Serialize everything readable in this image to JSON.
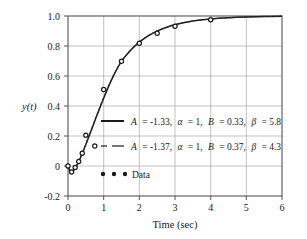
{
  "chart_data": {
    "type": "line",
    "title": "",
    "xlabel": "Time (sec)",
    "ylabel": "y(t)",
    "xlim": [
      0,
      6
    ],
    "ylim": [
      -0.2,
      1.0
    ],
    "grid": true,
    "xticks": [
      0,
      1,
      2,
      3,
      4,
      5,
      6
    ],
    "xtick_labels": [
      "0",
      "1",
      "2",
      "3",
      "4",
      "5",
      "6"
    ],
    "yticks": [
      -0.2,
      0,
      0.2,
      0.4,
      0.6,
      0.8,
      1.0
    ],
    "ytick_labels": [
      "-0.2",
      "0",
      "0.2",
      "0.4",
      "0.6",
      "0.8",
      "1.0"
    ],
    "legend_position": "center",
    "series": [
      {
        "name": "model-1-solid",
        "style": "solid",
        "color": "#1a1a1a",
        "label_parts": {
          "A_name": "A",
          "A_value": "= -1.33,",
          "alpha_name": "α",
          "alpha_value": "= 1,",
          "B_name": "B",
          "B_value": "= 0.33,",
          "beta_name": "β",
          "beta_value": "= 5.8"
        },
        "params": {
          "A": -1.33,
          "alpha": 1,
          "B": 0.33,
          "beta": 5.8
        },
        "x": [
          0,
          0.05,
          0.1,
          0.15,
          0.2,
          0.25,
          0.3,
          0.4,
          0.5,
          0.6,
          0.8,
          1.0,
          1.25,
          1.5,
          1.75,
          2.0,
          2.25,
          2.5,
          2.75,
          3.0,
          3.5,
          4.0,
          4.5,
          5.0,
          5.5,
          6.0
        ],
        "y": [
          0,
          -0.03,
          -0.04,
          -0.032,
          -0.017,
          0.004,
          0.028,
          0.083,
          0.143,
          0.205,
          0.331,
          0.452,
          0.589,
          0.697,
          0.77,
          0.826,
          0.868,
          0.899,
          0.923,
          0.941,
          0.966,
          0.98,
          0.988,
          0.993,
          0.996,
          0.998
        ]
      },
      {
        "name": "model-2-dashed",
        "style": "dashed",
        "color": "#1a1a1a",
        "label_parts": {
          "A_name": "A",
          "A_value": "= -1.37,",
          "alpha_name": "α",
          "alpha_value": "= 1,",
          "B_name": "B",
          "B_value": "= 0.37,",
          "beta_name": "β",
          "beta_value": "= 4.3"
        },
        "params": {
          "A": -1.37,
          "alpha": 1,
          "B": 0.37,
          "beta": 4.3
        },
        "x": [
          0,
          0.05,
          0.1,
          0.15,
          0.2,
          0.25,
          0.3,
          0.4,
          0.5,
          0.6,
          0.8,
          1.0,
          1.25,
          1.5,
          1.75,
          2.0,
          2.25,
          2.5,
          2.75,
          3.0,
          3.5,
          4.0,
          4.5,
          5.0,
          5.5,
          6.0
        ],
        "y": [
          0,
          -0.028,
          -0.038,
          -0.031,
          -0.015,
          0.007,
          0.032,
          0.088,
          0.148,
          0.21,
          0.336,
          0.457,
          0.593,
          0.7,
          0.773,
          0.828,
          0.87,
          0.9,
          0.924,
          0.942,
          0.967,
          0.98,
          0.988,
          0.993,
          0.996,
          0.998
        ]
      }
    ],
    "data_points": {
      "name": "Data",
      "label": "Data",
      "marker": "circle",
      "color": "#1a1a1a",
      "x": [
        0.0,
        0.1,
        0.2,
        0.3,
        0.4,
        0.5,
        0.75,
        1.0,
        1.5,
        2.0,
        2.5,
        3.0,
        4.0
      ],
      "y": [
        0.0,
        -0.04,
        -0.01,
        0.03,
        0.085,
        0.205,
        0.133,
        0.51,
        0.698,
        0.818,
        0.885,
        0.932,
        0.975
      ]
    }
  },
  "legend": {
    "entries": [
      {
        "sample": "solid-line",
        "name": "legend-entry-solid"
      },
      {
        "sample": "dashed-line",
        "name": "legend-entry-dashed"
      },
      {
        "sample": "dot-markers",
        "name": "legend-entry-data",
        "label": "Data"
      }
    ]
  }
}
